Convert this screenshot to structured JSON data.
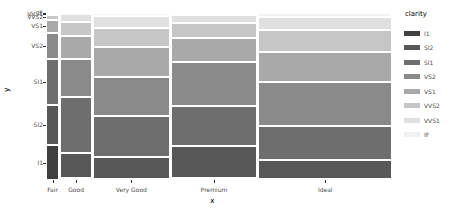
{
  "chart_data": {
    "type": "mosaic",
    "title": "",
    "xlabel": "x",
    "ylabel": "y",
    "legend_title": "clarity",
    "legend_position": "right",
    "grid": false,
    "categories": [
      "Fair",
      "Good",
      "Very Good",
      "Premium",
      "Ideal"
    ],
    "column_widths": [
      0.0334,
      0.0906,
      0.224,
      0.2557,
      0.3963
    ],
    "levels": [
      "I1",
      "SI2",
      "SI1",
      "VS2",
      "VS1",
      "VVS2",
      "VVS1",
      "IF"
    ],
    "level_colors": [
      "#3f3f3f",
      "#575757",
      "#6e6e6e",
      "#8a8a8a",
      "#a9a9a9",
      "#c6c6c6",
      "#e0e0e0",
      "#f2f2f2"
    ],
    "series": [
      {
        "name": "I1",
        "values": [
          0.2104,
          0.0091,
          0.0086,
          0.013,
          0.0031
        ]
      },
      {
        "name": "SI2",
        "values": [
          0.2406,
          0.1553,
          0.1316,
          0.1933,
          0.1152
        ]
      },
      {
        "name": "SI1",
        "values": [
          0.2758,
          0.3314,
          0.2437,
          0.2393,
          0.2056
        ]
      },
      {
        "name": "VS2",
        "values": [
          0.1551,
          0.2272,
          0.2306,
          0.2608,
          0.2622
        ]
      },
      {
        "name": "VS1",
        "values": [
          0.0841,
          0.14,
          0.1795,
          0.1427,
          0.1803
        ]
      },
      {
        "name": "VVS2",
        "values": [
          0.0266,
          0.0826,
          0.1179,
          0.0892,
          0.1312
        ]
      },
      {
        "name": "VVS1",
        "values": [
          0.0106,
          0.0466,
          0.0725,
          0.0482,
          0.0783
        ]
      },
      {
        "name": "IF",
        "values": [
          0.0019,
          0.0078,
          0.0155,
          0.0134,
          0.024
        ]
      }
    ]
  },
  "axes": {
    "x_title": "x",
    "y_title": "y",
    "x_ticks": [
      "Fair",
      "Good",
      "Very Good",
      "Premium",
      "Ideal"
    ],
    "y_ticks": [
      "I1",
      "SI2",
      "SI1",
      "VS2",
      "VS1",
      "VVS2",
      "VVS1",
      "IF"
    ]
  },
  "legend": {
    "title": "clarity",
    "items": [
      {
        "label": "I1",
        "color": "#3f3f3f"
      },
      {
        "label": "SI2",
        "color": "#575757"
      },
      {
        "label": "SI1",
        "color": "#6e6e6e"
      },
      {
        "label": "VS2",
        "color": "#8a8a8a"
      },
      {
        "label": "VS1",
        "color": "#a9a9a9"
      },
      {
        "label": "VVS2",
        "color": "#c6c6c6"
      },
      {
        "label": "VVS1",
        "color": "#e0e0e0"
      },
      {
        "label": "IF",
        "color": "#f2f2f2"
      }
    ]
  }
}
